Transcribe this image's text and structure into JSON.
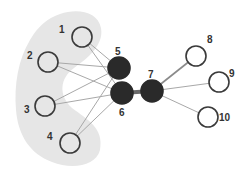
{
  "diagram": {
    "type": "network-graph",
    "colors": {
      "background": "#ffffff",
      "group_fill": "#e6e6e6",
      "hollow_stroke": "#3a3a3a",
      "filled_node": "#2a2a2a",
      "edge_light": "#a8a8a8",
      "edge_dark": "#6a6a6a",
      "label": "#333333"
    },
    "group": {
      "name": "input-cluster",
      "members": [
        "1",
        "2",
        "3",
        "4"
      ]
    },
    "nodes": [
      {
        "id": "1",
        "label": "1",
        "x": 82,
        "y": 37,
        "r": 10,
        "style": "hollow",
        "lx": 59,
        "ly": 33
      },
      {
        "id": "2",
        "label": "2",
        "x": 48,
        "y": 62,
        "r": 10,
        "style": "hollow",
        "lx": 27,
        "ly": 59
      },
      {
        "id": "3",
        "label": "3",
        "x": 45,
        "y": 106,
        "r": 10,
        "style": "hollow",
        "lx": 24,
        "ly": 113
      },
      {
        "id": "4",
        "label": "4",
        "x": 70,
        "y": 143,
        "r": 10,
        "style": "hollow",
        "lx": 47,
        "ly": 140
      },
      {
        "id": "5",
        "label": "5",
        "x": 119,
        "y": 68,
        "r": 11,
        "style": "filled",
        "lx": 115,
        "ly": 55
      },
      {
        "id": "6",
        "label": "6",
        "x": 122,
        "y": 93,
        "r": 11,
        "style": "filled",
        "lx": 119,
        "ly": 116
      },
      {
        "id": "7",
        "label": "7",
        "x": 152,
        "y": 91,
        "r": 11,
        "style": "filled",
        "lx": 148,
        "ly": 78
      },
      {
        "id": "8",
        "label": "8",
        "x": 196,
        "y": 56,
        "r": 10,
        "style": "hollow",
        "lx": 207,
        "ly": 43
      },
      {
        "id": "9",
        "label": "9",
        "x": 219,
        "y": 82,
        "r": 10,
        "style": "hollow",
        "lx": 229,
        "ly": 77
      },
      {
        "id": "10",
        "label": "10",
        "x": 208,
        "y": 117,
        "r": 10,
        "style": "hollow",
        "lx": 219,
        "ly": 121
      }
    ],
    "edges": [
      {
        "from": "1",
        "to": "5",
        "weight": "light"
      },
      {
        "from": "1",
        "to": "6",
        "weight": "light"
      },
      {
        "from": "2",
        "to": "5",
        "weight": "light"
      },
      {
        "from": "2",
        "to": "6",
        "weight": "light"
      },
      {
        "from": "3",
        "to": "5",
        "weight": "light"
      },
      {
        "from": "3",
        "to": "6",
        "weight": "light"
      },
      {
        "from": "4",
        "to": "5",
        "weight": "light"
      },
      {
        "from": "4",
        "to": "6",
        "weight": "light"
      },
      {
        "from": "6",
        "to": "7",
        "weight": "heavy"
      },
      {
        "from": "7",
        "to": "8",
        "weight": "medium"
      },
      {
        "from": "7",
        "to": "9",
        "weight": "light"
      },
      {
        "from": "7",
        "to": "10",
        "weight": "light"
      }
    ]
  }
}
